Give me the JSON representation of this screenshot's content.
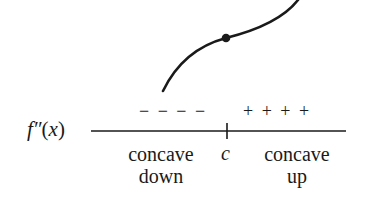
{
  "diagram": {
    "function_label": {
      "name": "f",
      "primes": "″",
      "open_paren": "(",
      "variable": "x",
      "close_paren": ")"
    },
    "sign_chart": {
      "left_signs": "− − − −",
      "right_signs": "+ + + +",
      "critical_point": "c"
    },
    "regions": {
      "left": {
        "line1": "concave",
        "line2": "down"
      },
      "right": {
        "line1": "concave",
        "line2": "up"
      }
    },
    "curve": {
      "description": "S-shaped curve, concave down then concave up",
      "inflection_point_marker": "filled-dot"
    },
    "colors": {
      "stroke": "#1a1a1a",
      "background": "#ffffff"
    }
  }
}
